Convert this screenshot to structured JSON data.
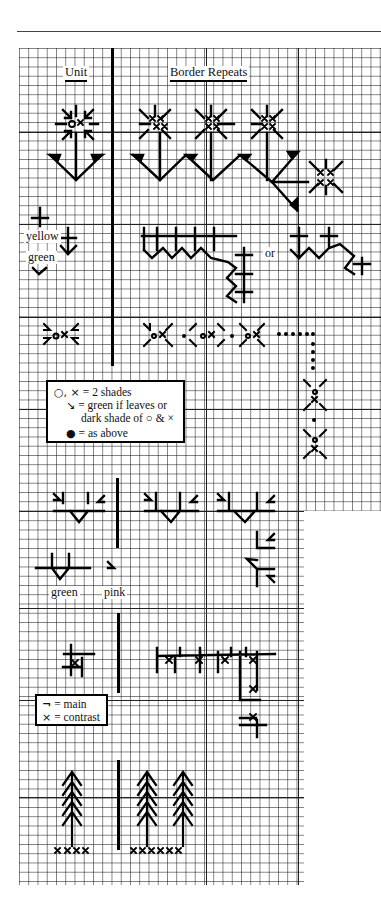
{
  "headings": {
    "unit": "Unit",
    "border_repeats": "Border Repeats"
  },
  "labels": {
    "yellow": "yellow",
    "green_top": "green",
    "or": "or",
    "green_bottom": "green",
    "pink": "pink"
  },
  "legend1": {
    "rows": [
      {
        "symbol": "○, ×",
        "text": "= 2 shades"
      },
      {
        "symbol": "↘",
        "text": "= green if leaves or"
      },
      {
        "symbol": "",
        "text": "dark shade of ○ & ×"
      },
      {
        "symbol": "●",
        "text": "= as above"
      }
    ]
  },
  "legend2": {
    "rows": [
      {
        "symbol": "¬",
        "text": "= main"
      },
      {
        "symbol": "×",
        "text": "= contrast"
      }
    ]
  },
  "grid": {
    "cell_size_px": 9.25,
    "line_color": "#333333",
    "ink_color": "#000000"
  },
  "sections": [
    {
      "name": "flower-border",
      "unit": "flower with V leaves",
      "repeat": "zigzag flower border with corner"
    },
    {
      "name": "yellow-green-arrow-border",
      "unit": "cross + arrow",
      "repeat": "zigzag arrows with corner, or spaced variant"
    },
    {
      "name": "circle-cross-border",
      "unit": "circle-cross with arrow leaves",
      "repeat": "dotted corner border"
    },
    {
      "name": "leaf-v-border",
      "unit": "V leaves",
      "repeat": "V-leaf border with corner"
    },
    {
      "name": "geometric-border",
      "unit": "hooked cross",
      "repeat": "hooked corner border"
    },
    {
      "name": "tree-border",
      "unit": "single pine tree",
      "repeat": "pair of pine trees"
    }
  ]
}
